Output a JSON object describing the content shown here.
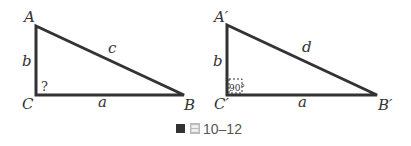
{
  "triangle1": {
    "vertices": {
      "A": "A",
      "B": "B",
      "C": "C"
    },
    "sides": {
      "b": "b",
      "c": "c",
      "a": "a"
    },
    "angle_C": "?"
  },
  "triangle2": {
    "vertices": {
      "A": "A′",
      "B": "B′",
      "C": "C′"
    },
    "sides": {
      "b": "b",
      "d": "d",
      "a": "a"
    },
    "angle_C": "90°"
  },
  "caption": {
    "icon": "figure-icon",
    "number": "10–12"
  },
  "colors": {
    "stroke": "#333333",
    "caption": "#555555"
  }
}
